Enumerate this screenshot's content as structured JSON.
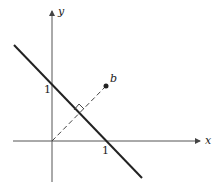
{
  "diagram": {
    "axes": {
      "x_label": "x",
      "y_label": "y"
    },
    "ticks": {
      "x_one": "1",
      "y_one": "1"
    },
    "point": {
      "label": "b"
    },
    "colors": {
      "line": "#222222",
      "axis": "#444444"
    }
  }
}
